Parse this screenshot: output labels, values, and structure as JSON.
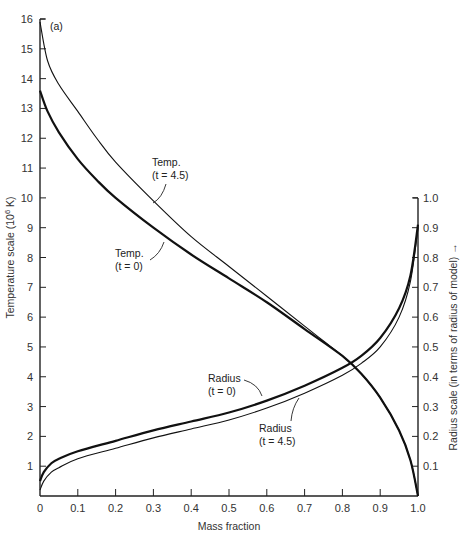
{
  "chart_data": {
    "type": "line",
    "title": "",
    "panel_label": "(a)",
    "xlabel": "Mass fraction",
    "ylabel": "Temperature scale (10^6 K)",
    "ylabel_parts": {
      "main": "Temperature scale (10",
      "sup": "6",
      "end": " K)"
    },
    "y2label": "Radius scale (in terms of radius of model) →",
    "xlim": [
      0,
      1.0
    ],
    "ylim": [
      0,
      16
    ],
    "y2lim": [
      0,
      1.0
    ],
    "grid": false,
    "x_ticks": [
      "0",
      "0.1",
      "0.2",
      "0.3",
      "0.4",
      "0.5",
      "0.6",
      "0.7",
      "0.8",
      "0.9",
      "1.0"
    ],
    "y_ticks": [
      "1",
      "2",
      "3",
      "4",
      "5",
      "6",
      "7",
      "8",
      "9",
      "10",
      "11",
      "12",
      "13",
      "14",
      "15",
      "16"
    ],
    "y2_ticks": [
      "0.1",
      "0.2",
      "0.3",
      "0.4",
      "0.5",
      "0.6",
      "0.7",
      "0.8",
      "0.9",
      "1.0"
    ],
    "series": [
      {
        "name": "Temp. (t = 0)",
        "axis": "left",
        "weight": "heavy",
        "x": [
          0,
          0.02,
          0.05,
          0.1,
          0.15,
          0.2,
          0.3,
          0.4,
          0.5,
          0.6,
          0.7,
          0.8,
          0.85,
          0.9,
          0.95,
          0.98,
          1.0
        ],
        "y": [
          13.6,
          12.9,
          12.2,
          11.3,
          10.6,
          10.0,
          9.0,
          8.1,
          7.3,
          6.5,
          5.6,
          4.7,
          4.1,
          3.3,
          2.2,
          1.2,
          0.0
        ]
      },
      {
        "name": "Temp. (t = 4.5)",
        "axis": "left",
        "weight": "light",
        "x": [
          0,
          0.02,
          0.05,
          0.1,
          0.15,
          0.2,
          0.3,
          0.4,
          0.5,
          0.6,
          0.7,
          0.75,
          0.8,
          0.85,
          0.9,
          0.95,
          0.98,
          1.0
        ],
        "y": [
          15.9,
          14.6,
          13.8,
          12.9,
          12.0,
          11.2,
          9.9,
          8.7,
          7.7,
          6.7,
          5.7,
          5.2,
          4.7,
          4.1,
          3.3,
          2.2,
          1.2,
          0.0
        ]
      },
      {
        "name": "Radius (t = 0)",
        "axis": "right",
        "weight": "heavy",
        "x": [
          0,
          0.01,
          0.03,
          0.05,
          0.1,
          0.2,
          0.3,
          0.4,
          0.5,
          0.6,
          0.7,
          0.8,
          0.85,
          0.9,
          0.95,
          0.98,
          1.0
        ],
        "y": [
          0.05,
          0.08,
          0.11,
          0.125,
          0.15,
          0.185,
          0.22,
          0.25,
          0.28,
          0.32,
          0.37,
          0.43,
          0.47,
          0.53,
          0.63,
          0.74,
          0.91
        ]
      },
      {
        "name": "Radius (t = 4.5)",
        "axis": "right",
        "weight": "light",
        "x": [
          0,
          0.01,
          0.03,
          0.05,
          0.1,
          0.2,
          0.3,
          0.4,
          0.5,
          0.6,
          0.7,
          0.8,
          0.85,
          0.9,
          0.95,
          0.98,
          1.0
        ],
        "y": [
          0.02,
          0.05,
          0.08,
          0.095,
          0.125,
          0.16,
          0.195,
          0.225,
          0.255,
          0.295,
          0.345,
          0.405,
          0.445,
          0.5,
          0.6,
          0.72,
          0.9
        ]
      }
    ],
    "annotations": [
      {
        "id": "temp45",
        "line1": "Temp.",
        "line2": "(t = 4.5)"
      },
      {
        "id": "temp0",
        "line1": "Temp.",
        "line2": "(t = 0)"
      },
      {
        "id": "rad0",
        "line1": "Radius",
        "line2": "(t = 0)"
      },
      {
        "id": "rad45",
        "line1": "Radius",
        "line2": "(t = 4.5)"
      }
    ]
  }
}
